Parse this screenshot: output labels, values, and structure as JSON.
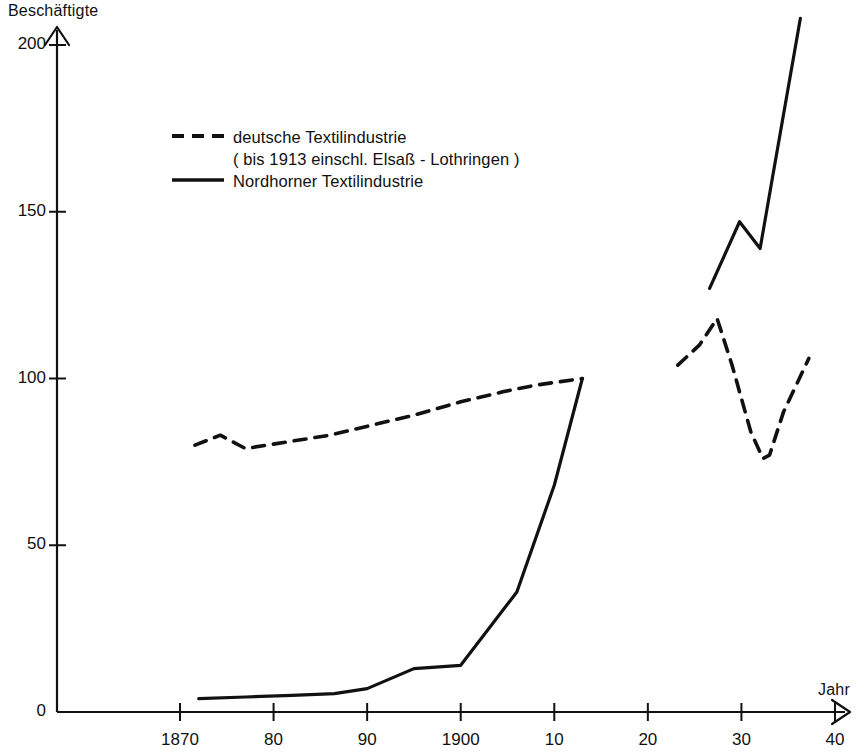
{
  "chart_data": {
    "type": "line",
    "title": "",
    "xlabel": "Jahr",
    "ylabel": "Beschäftigte",
    "xlim": [
      1868,
      1941
    ],
    "ylim": [
      0,
      210
    ],
    "grid": false,
    "legend_position": "upper-left",
    "x_tick_values": [
      1870,
      1880,
      1890,
      1900,
      1910,
      1920,
      1930,
      1940
    ],
    "x_tick_labels": [
      "1870",
      "80",
      "90",
      "1900",
      "10",
      "20",
      "30",
      "40"
    ],
    "y_tick_values": [
      0,
      50,
      100,
      150,
      200
    ],
    "y_tick_labels": [
      "0",
      "50",
      "100",
      "150",
      "200"
    ],
    "series": [
      {
        "name": "deutsche Textilindustrie",
        "note": "( bis 1913 einschl. Elsaß - Lothringen )",
        "style": "dashed",
        "color": "#111111",
        "segments": [
          {
            "x": [
              1871.6,
              1874.3,
              1877.0,
              1881.5,
              1886.0,
              1890.5,
              1895.0,
              1900.0,
              1904.5,
              1908.0,
              1913.0
            ],
            "y": [
              80,
              83,
              79,
              81,
              83,
              86,
              89,
              93,
              96,
              98,
              100
            ]
          },
          {
            "x": [
              1923.2,
              1925.5,
              1927.4,
              1929.0,
              1931.0,
              1932.3,
              1933.0,
              1934.5,
              1937.2
            ],
            "y": [
              104,
              110,
              118,
              104,
              84,
              76,
              77,
              90,
              106
            ]
          }
        ]
      },
      {
        "name": "Nordhorner Textilindustrie",
        "style": "solid",
        "color": "#111111",
        "segments": [
          {
            "x": [
              1872.0,
              1877.0,
              1882.0,
              1886.5,
              1890.0,
              1895.0,
              1900.0,
              1906.0,
              1910.0,
              1913.0
            ],
            "y": [
              4,
              4.5,
              5,
              5.5,
              7,
              13,
              14,
              36,
              68,
              100
            ]
          },
          {
            "x": [
              1926.6,
              1929.8,
              1932.0,
              1933.3,
              1936.3
            ],
            "y": [
              127,
              147,
              139,
              160,
              208
            ]
          }
        ]
      }
    ]
  },
  "axes": {
    "y_axis_title": "Beschäftigte",
    "x_axis_title": "Jahr"
  },
  "legend": {
    "entries": [
      {
        "label": "deutsche Textilindustrie",
        "sublabel": "( bis 1913 einschl. Elsaß - Lothringen )",
        "marker": "dashed-line-swatch"
      },
      {
        "label": "Nordhorner Textilindustrie",
        "sublabel": "",
        "marker": "solid-line-swatch"
      }
    ]
  },
  "colors": {
    "ink": "#111111",
    "background": "#ffffff"
  }
}
